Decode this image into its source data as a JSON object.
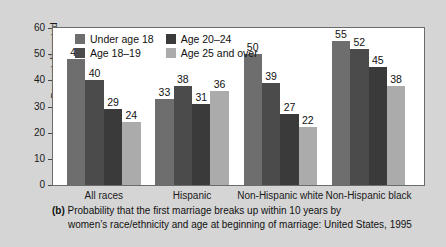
{
  "chart_data": {
    "type": "bar",
    "title": "",
    "xlabel": "",
    "ylabel": "Percent disrupted",
    "ylim": [
      0,
      60
    ],
    "yticks": [
      0,
      10,
      20,
      30,
      40,
      50,
      60
    ],
    "grid": false,
    "legend_position": "top-left inside plot",
    "categories": [
      "All races",
      "Hispanic",
      "Non-Hispanic white",
      "Non-Hispanic black"
    ],
    "series": [
      {
        "name": "Under age 18",
        "color": "#6e6e6e",
        "values": [
          48,
          33,
          50,
          55
        ]
      },
      {
        "name": "Age 18–19",
        "color": "#4b4b4b",
        "values": [
          40,
          38,
          39,
          52
        ]
      },
      {
        "name": "Age 20–24",
        "color": "#3a3a3a",
        "values": [
          29,
          31,
          27,
          45
        ]
      },
      {
        "name": "Age 25 and over",
        "color": "#ababab",
        "values": [
          24,
          36,
          22,
          38
        ]
      }
    ],
    "legend_order": [
      "Under age 18",
      "Age 20–24",
      "Age 18–19",
      "Age 25 and over"
    ]
  },
  "caption": {
    "panel_label": "(b)",
    "line1": "Probability that the first marriage breaks up within 10 years by",
    "line2": "women’s race/ethnicity and age at beginning of marriage: United States, 1995"
  },
  "colors": {
    "page_background": "#d5d5d5",
    "plot_background": "#ffffff",
    "frame": "#6b6b6b",
    "text": "#111111"
  }
}
